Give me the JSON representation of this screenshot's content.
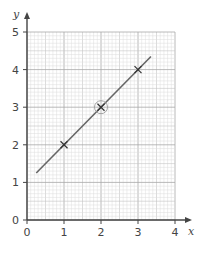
{
  "chart_data": {
    "type": "line",
    "title": "",
    "xlabel": "x",
    "ylabel": "y",
    "xlim": [
      0,
      4
    ],
    "ylim": [
      0,
      5
    ],
    "x_ticks": [
      "0",
      "1",
      "2",
      "3",
      "4"
    ],
    "y_ticks": [
      "0",
      "1",
      "2",
      "3",
      "4",
      "5"
    ],
    "grid": {
      "on": true,
      "major_step": 1,
      "minor_step": 0.1,
      "mid_step": 0.5
    },
    "series": [
      {
        "name": "line",
        "kind": "line",
        "x": [
          0.25,
          3.35
        ],
        "y": [
          1.25,
          4.35
        ],
        "equation": "y = x + 1"
      },
      {
        "name": "plotted points",
        "kind": "scatter",
        "marker": "x",
        "x": [
          1,
          2,
          3
        ],
        "y": [
          2,
          3,
          4
        ]
      }
    ],
    "annotations": [
      {
        "type": "circle",
        "x": 2,
        "y": 3,
        "note": "point (2,3) circled"
      }
    ],
    "colors": {
      "line": "#666666",
      "marker": "#333333",
      "axis": "#444444",
      "grid_minor": "#dcdcdc",
      "grid_mid": "#c4c4c4",
      "grid_major": "#a8a8a8"
    }
  }
}
